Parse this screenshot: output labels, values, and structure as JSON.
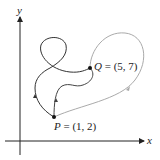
{
  "diagram": {
    "axes": {
      "x_label": "x",
      "y_label": "y"
    },
    "points": {
      "P": {
        "name": "P",
        "eq": " = (1, 2)",
        "coords": [
          1,
          2
        ]
      },
      "Q": {
        "name": "Q",
        "eq": " = (5, 7)",
        "coords": [
          5,
          7
        ]
      }
    },
    "curves": [
      {
        "name": "left-loop-path",
        "color": "#333333",
        "description": "path from P looping up-left through a loop to Q"
      },
      {
        "name": "middle-wavy-path",
        "color": "#444444",
        "description": "wavy path from P to Q"
      },
      {
        "name": "right-gray-path",
        "color": "#aaaaaa",
        "description": "wide lighter path from P sweeping right up to Q"
      }
    ],
    "colors": {
      "axis": "#222222",
      "dark_curve": "#333333",
      "light_curve": "#aaaaaa"
    }
  }
}
